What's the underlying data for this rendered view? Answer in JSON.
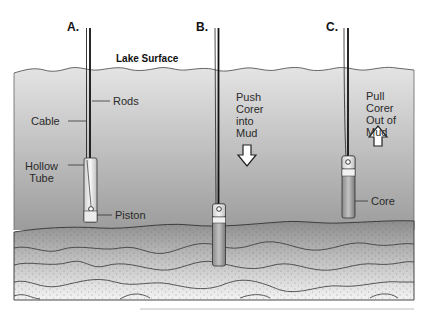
{
  "diagram": {
    "steps": [
      {
        "id": "A",
        "label": "A."
      },
      {
        "id": "B",
        "label": "B."
      },
      {
        "id": "C",
        "label": "C."
      }
    ],
    "surface_label": "Lake Surface",
    "parts": {
      "rods": "Rods",
      "cable": "Cable",
      "hollow_tube": "Hollow\nTube",
      "piston": "Piston",
      "core": "Core"
    },
    "actions": {
      "push": "Push\nCorer\ninto\nMud",
      "pull": "Pull\nCorer\nOut of\nMud"
    },
    "colors": {
      "water_top": "#d6d6d6",
      "water_bottom": "#9a9a9a",
      "mud_dark": "#8a8a8a",
      "mud_light": "#f2f2f2",
      "outline": "#333333"
    }
  }
}
